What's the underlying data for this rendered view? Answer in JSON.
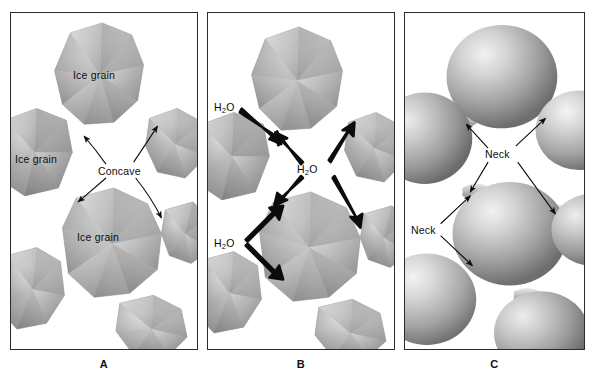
{
  "figure": {
    "background_color": "#ffffff",
    "border_color": "#2b2b2b",
    "panel_count": 3
  },
  "panels": [
    {
      "id": "A",
      "caption": "A",
      "description": "Faceted angular ice grains separated by concave pore spaces",
      "labels": [
        {
          "key": "ice_grain_top",
          "text": "Ice grain"
        },
        {
          "key": "ice_grain_left",
          "text": "Ice grain"
        },
        {
          "key": "ice_grain_center",
          "text": "Ice grain"
        },
        {
          "key": "concave",
          "text": "Concave"
        }
      ],
      "arrow_count": 4,
      "arrow_style": "thin",
      "grain_style": "faceted-polygon"
    },
    {
      "id": "B",
      "caption": "B",
      "description": "Water vapor diffusing from convex grain surfaces toward concave necks",
      "labels": [
        {
          "key": "h2o_upper_left",
          "text": "H2O",
          "formula": {
            "element1": "H",
            "subscript": "2",
            "element2": "O"
          }
        },
        {
          "key": "h2o_center",
          "text": "H2O",
          "formula": {
            "element1": "H",
            "subscript": "2",
            "element2": "O"
          }
        },
        {
          "key": "h2o_lower_left",
          "text": "H2O",
          "formula": {
            "element1": "H",
            "subscript": "2",
            "element2": "O"
          }
        }
      ],
      "arrow_count": 7,
      "arrow_style": "thick-tapered",
      "grain_style": "faceted-polygon"
    },
    {
      "id": "C",
      "caption": "C",
      "description": "Rounded sintered grains bonded by necks",
      "labels": [
        {
          "key": "neck_upper",
          "text": "Neck"
        },
        {
          "key": "neck_lower",
          "text": "Neck"
        }
      ],
      "arrow_count": 6,
      "arrow_style": "thin",
      "grain_style": "rounded-sphere"
    }
  ],
  "colors": {
    "grain_light": "#d9d9d9",
    "grain_mid": "#a8a8a8",
    "grain_dark": "#7d7d7d",
    "grain_shadow": "#6a6a6a",
    "highlight": "#efefef",
    "ink": "#0c0c0c",
    "border": "#2b2b2b",
    "paper": "#ffffff"
  }
}
